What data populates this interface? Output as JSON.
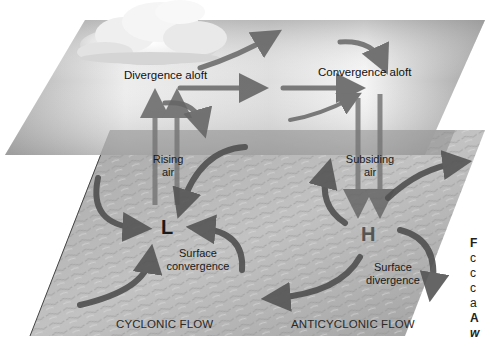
{
  "diagram": {
    "upper_plane": {
      "left_label": "Divergence aloft",
      "right_label": "Convergence aloft"
    },
    "vertical_motion": {
      "left_label_line1": "Rising",
      "left_label_line2": "air",
      "right_label_line1": "Subsiding",
      "right_label_line2": "air"
    },
    "pressure_centers": {
      "low": "L",
      "high": "H"
    },
    "surface": {
      "left_label_line1": "Surface",
      "left_label_line2": "convergence",
      "right_label_line1": "Surface",
      "right_label_line2": "divergence"
    },
    "flow_labels": {
      "left": "CYCLONIC FLOW",
      "right": "ANTICYCLONIC FLOW"
    },
    "caption_fragment": {
      "lines": [
        "F",
        "c",
        "c",
        "c",
        "a",
        "A",
        "w"
      ]
    },
    "colors": {
      "arrow": "#6b6b6b",
      "upper_plane_dark": "#8c8c8c",
      "upper_plane_light": "#f2f2f2",
      "surface": "#b3b3b3",
      "low_label": "#1a1a1a",
      "high_label": "#555555"
    }
  }
}
